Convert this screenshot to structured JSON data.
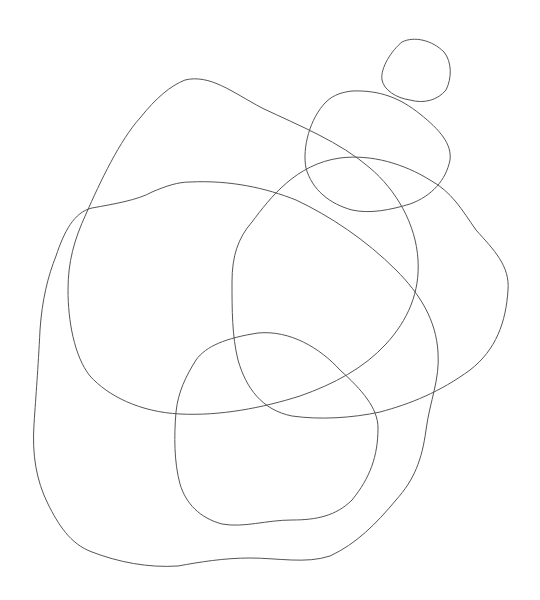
{
  "canvas": {
    "width": 540,
    "height": 600,
    "background": "#ffffff"
  },
  "stroke_color": "#555555",
  "shapes": [
    {
      "name": "small-circle",
      "d": "M 402 42 C 414 36 432 40 444 52 C 452 62 452 78 446 90 C 438 100 424 104 410 100 C 396 98 384 90 382 80 C 380 68 392 50 402 42 Z"
    },
    {
      "name": "medium-blob",
      "d": "M 352 91 C 380 90 400 98 420 114 C 440 130 452 144 450 160 C 446 180 432 196 410 204 C 390 210 370 214 352 210 C 330 204 312 190 306 168 C 302 148 310 118 326 102 C 334 94 344 92 352 91 Z"
    },
    {
      "name": "large-blob-a",
      "d": "M 185 80 C 210 74 232 92 262 108 C 300 126 340 142 370 168 C 396 190 416 224 418 260 C 420 292 408 320 386 344 C 364 368 334 384 300 396 C 262 408 220 416 180 414 C 140 412 108 396 90 376 C 74 356 68 320 68 290 C 68 262 74 240 86 214 C 100 182 120 140 140 118 C 156 98 170 86 185 80 Z"
    },
    {
      "name": "large-blob-b",
      "d": "M 340 158 C 372 154 404 164 430 180 C 452 192 462 210 476 230 C 494 250 510 266 508 290 C 506 322 496 350 470 370 C 440 392 410 404 380 412 C 352 418 320 420 292 416 C 262 410 246 388 238 360 C 232 336 232 310 232 282 C 232 256 238 238 252 222 C 270 198 296 164 340 158 Z"
    },
    {
      "name": "large-blob-c",
      "d": "M 190 182 C 230 180 266 188 296 200 C 330 216 366 240 396 270 C 420 294 436 320 438 352 C 440 380 430 400 426 430 C 422 460 414 480 396 500 C 376 524 356 544 330 556 C 306 564 278 558 250 558 C 224 558 200 562 178 566 C 148 568 118 562 92 552 C 70 544 58 524 48 504 C 36 480 32 454 34 424 C 36 394 38 370 40 330 C 42 300 48 276 56 256 C 64 232 74 212 92 208 C 114 204 138 200 152 192 C 166 186 178 182 190 182 Z"
    },
    {
      "name": "blob-d",
      "d": "M 258 333 C 290 330 320 348 340 370 C 362 390 378 408 378 428 C 378 456 370 478 352 500 C 336 516 316 520 292 520 C 266 520 244 528 222 524 C 200 518 186 504 180 484 C 174 462 174 436 176 412 C 178 392 186 376 196 360 C 206 346 226 338 258 333 Z"
    }
  ]
}
